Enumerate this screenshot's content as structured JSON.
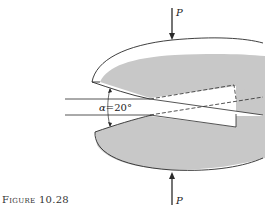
{
  "figure": {
    "caption_word": "Figure",
    "caption_number": "10.28",
    "load_top_label": "P",
    "load_bottom_label": "P",
    "angle_symbol": "α",
    "angle_equals": "=",
    "angle_value": "20°"
  },
  "colors": {
    "jaw_fill": "#c8c8c8",
    "line": "#2a2a2a",
    "background": "#ffffff"
  }
}
